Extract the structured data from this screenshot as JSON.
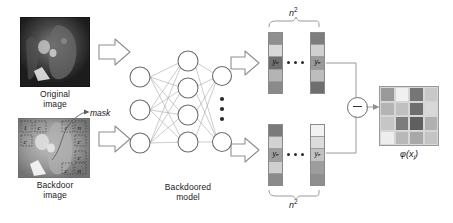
{
  "figure": {
    "labels": {
      "original_image": "Original\nimage",
      "backdoor_image": "Backdoor\nimage",
      "model": "Backdoored\nmodel",
      "mask": "mask",
      "n_squared": "n",
      "n_squared_exp": "2",
      "output": "φ(x",
      "output_sub": "i",
      "output_tail": ")",
      "minus": "−"
    },
    "original_caption_line1": "Original",
    "original_caption_line2": "image",
    "backdoor_caption_line1": "Backdoor",
    "backdoor_caption_line2": "image",
    "model_caption_line1": "Backdoored",
    "model_caption_line2": "model",
    "vector_labels": {
      "top_left": "yₑ",
      "top_right": "yₑ",
      "bottom_left": "yₑ",
      "bottom_right": "yₑ"
    },
    "mask_corner_marks": [
      "1",
      "c",
      "c",
      "n",
      "c",
      "c",
      "c",
      "c",
      "n"
    ]
  },
  "colors": {
    "vector_top_left": [
      "#8f8f8f",
      "#d8d8d8",
      "#6f6f6f",
      "#b4b4b4",
      "#8a8a8a"
    ],
    "vector_top_right": [
      "#7d7d7d",
      "#d0d0d0",
      "#9a9a9a",
      "#bdbdbd",
      "#6e6e6e"
    ],
    "vector_bottom_left": [
      "#7a7a7a",
      "#d2d2d2",
      "#9e9e9e",
      "#cfcfcf",
      "#8b8b8b"
    ],
    "vector_bottom_right": [
      "#f2f2f2",
      "#dcdcdc",
      "#c2c2c2",
      "#9d9d9d",
      "#8e8e8e"
    ],
    "heatmap": [
      "#9a9a9a",
      "#f0f0f0",
      "#767676",
      "#c8c8c8",
      "#b4b4b4",
      "#c0c0c0",
      "#6e6e6e",
      "#d8d8d8",
      "#c6c6c6",
      "#7c7c7c",
      "#5f5f5f",
      "#b0b0b0",
      "#ededed",
      "#b8b8b8",
      "#a8a8a8",
      "#c4c4c4"
    ],
    "arrow_fill": "#ffffff",
    "arrow_stroke": "#8a8a8a",
    "node_stroke": "#6a6a6a",
    "edge_stroke": "#9e9e9e",
    "text": "#1a1a1a"
  },
  "network": {
    "input_nodes": 3,
    "hidden_nodes": 4,
    "output_nodes": 2,
    "output_dots": 3
  },
  "chart_data": {
    "type": "heatmap",
    "rows": 4,
    "cols": 4,
    "values": [
      [
        0.4,
        0.94,
        0.22,
        0.72
      ],
      [
        0.6,
        0.66,
        0.18,
        0.82
      ],
      [
        0.7,
        0.28,
        0.08,
        0.57
      ],
      [
        0.92,
        0.63,
        0.51,
        0.69
      ]
    ],
    "colormap": "grayscale",
    "legend": "none",
    "grid": true
  }
}
